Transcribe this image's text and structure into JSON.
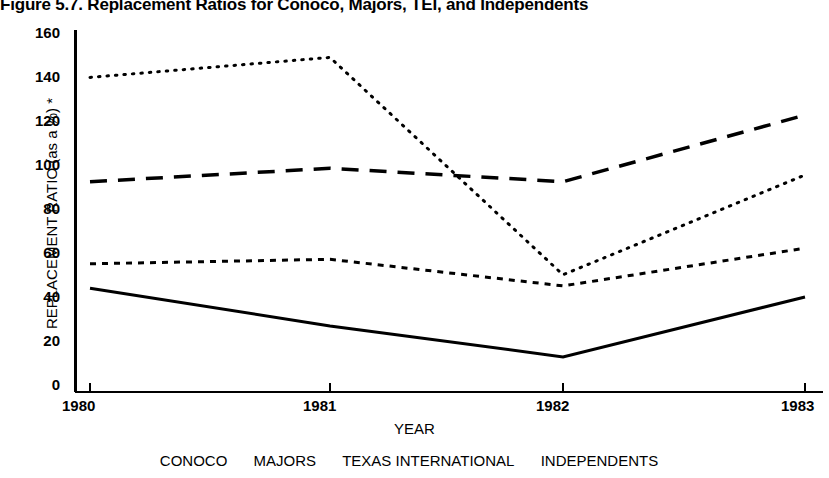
{
  "figure": {
    "title": "Figure 5.7.  Replacement Ratios for Conoco, Majors, TEI, and Independents"
  },
  "axes": {
    "ylabel": "REPLACEMENT RATIO (as a %) *",
    "xlabel": "YEAR",
    "yticks": [
      "160",
      "140",
      "120",
      "100",
      "80",
      "60",
      "40",
      "20",
      "0"
    ],
    "xticks": [
      "1980",
      "1981",
      "1982",
      "1983"
    ]
  },
  "legend": {
    "entries": [
      {
        "label": "CONOCO"
      },
      {
        "label": "MAJORS"
      },
      {
        "label": "TEXAS INTERNATIONAL"
      },
      {
        "label": "INDEPENDENTS"
      }
    ]
  },
  "chart_data": {
    "type": "line",
    "title": "Figure 5.7.  Replacement Ratios for Conoco, Majors, TEI, and Independents",
    "xlabel": "YEAR",
    "ylabel": "REPLACEMENT RATIO (as a %) *",
    "categories": [
      "1980",
      "1981",
      "1982",
      "1983"
    ],
    "x": [
      1980,
      1981,
      1982,
      1983
    ],
    "ylim": [
      0,
      160
    ],
    "ytick_step": 20,
    "grid": false,
    "legend_position": "below-axis",
    "series": [
      {
        "name": "CONOCO",
        "style": "solid",
        "color": "#000000",
        "values": [
          45,
          28,
          14,
          41
        ]
      },
      {
        "name": "MAJORS",
        "style": "dashed",
        "color": "#000000",
        "values": [
          93,
          99,
          93,
          123
        ]
      },
      {
        "name": "TEXAS INTERNATIONAL",
        "style": "dotted",
        "color": "#000000",
        "values": [
          140,
          149,
          51,
          96
        ]
      },
      {
        "name": "INDEPENDENTS",
        "style": "fine-dotted",
        "color": "#000000",
        "values": [
          56,
          58,
          46,
          63
        ]
      }
    ]
  }
}
